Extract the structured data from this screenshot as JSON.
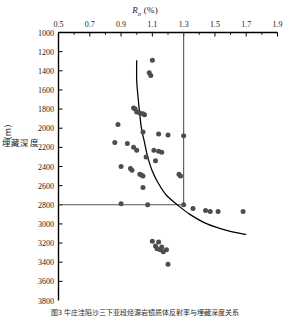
{
  "figure": {
    "caption": "图3  牛庄洼陷沙三下亚段烃源岩镜质体反射率与埋藏深度关系"
  },
  "chart_data": {
    "type": "scatter",
    "title": "",
    "xlabel": "Ro (%)",
    "xlabel_symbol": "R",
    "xlabel_subscript": "o",
    "xlabel_unit": "(%)",
    "ylabel": "埋藏深度 (m)",
    "ylabel_unit": "m",
    "ylabel_text": "埋藏深度",
    "xlim": [
      0.5,
      1.9
    ],
    "ylim": [
      1000,
      3800
    ],
    "y_inverted": true,
    "grid": false,
    "legend": null,
    "xticks": [
      0.5,
      0.7,
      0.9,
      1.1,
      1.3,
      1.5,
      1.7,
      1.9
    ],
    "xtick_labels": [
      "0.5",
      "0.7",
      "0.9",
      "1.1",
      "1.3",
      "1.5",
      "1.7",
      "1.9"
    ],
    "x_minor_ticks": [
      0.6,
      0.8,
      1.0,
      1.2,
      1.4,
      1.6,
      1.8
    ],
    "yticks": [
      1000,
      1200,
      1400,
      1600,
      1800,
      2000,
      2200,
      2400,
      2600,
      2800,
      3000,
      3200,
      3400,
      3600,
      3800
    ],
    "ytick_labels": [
      "1000",
      "1200",
      "1400",
      "1600",
      "1800",
      "2000",
      "2200",
      "2400",
      "2600",
      "2800",
      "3000",
      "3200",
      "3400",
      "3600",
      "3800"
    ],
    "point_color": "#4d4d4d",
    "line_color": "#000000",
    "reference_lines": [
      {
        "name": "ro-threshold",
        "orientation": "vertical",
        "value": 1.3,
        "label": "1.3",
        "from": 1000,
        "to": 2800,
        "color": "#555555"
      },
      {
        "name": "depth-threshold",
        "orientation": "horizontal",
        "value": 2800,
        "label": "2800",
        "from": 0.5,
        "to": 1.3,
        "color": "#555555"
      }
    ],
    "trend_curve": {
      "name": "maturity-trend",
      "points": [
        [
          1.0,
          1290
        ],
        [
          1.0,
          1500
        ],
        [
          1.01,
          1700
        ],
        [
          1.02,
          1860
        ],
        [
          1.03,
          2000
        ],
        [
          1.05,
          2150
        ],
        [
          1.07,
          2300
        ],
        [
          1.1,
          2450
        ],
        [
          1.14,
          2580
        ],
        [
          1.19,
          2700
        ],
        [
          1.26,
          2800
        ],
        [
          1.34,
          2900
        ],
        [
          1.45,
          3000
        ],
        [
          1.58,
          3070
        ],
        [
          1.7,
          3110
        ]
      ]
    },
    "series": [
      {
        "name": "source-rock-samples",
        "marker": "circle",
        "x": [
          1.1,
          1.08,
          1.09,
          0.98,
          0.99,
          1.0,
          1.02,
          1.04,
          1.05,
          0.88,
          1.04,
          1.14,
          1.2,
          1.3,
          0.86,
          0.94,
          0.98,
          1.0,
          1.11,
          1.14,
          1.16,
          1.06,
          1.12,
          0.9,
          0.96,
          0.97,
          1.02,
          1.03,
          1.04,
          1.27,
          1.28,
          1.04,
          0.9,
          1.07,
          1.3,
          1.36,
          1.44,
          1.47,
          1.52,
          1.68,
          1.1,
          1.14,
          1.12,
          1.16,
          1.13,
          1.15,
          1.19,
          1.17,
          1.2
        ],
        "y": [
          1290,
          1420,
          1450,
          1790,
          1800,
          1830,
          1840,
          1850,
          1860,
          1960,
          2040,
          2060,
          2070,
          2080,
          2150,
          2160,
          2200,
          2230,
          2230,
          2240,
          2250,
          2300,
          2340,
          2400,
          2420,
          2440,
          2480,
          2490,
          2500,
          2480,
          2500,
          2620,
          2790,
          2800,
          2800,
          2840,
          2860,
          2870,
          2870,
          2870,
          3180,
          3190,
          3230,
          3240,
          3260,
          3270,
          3270,
          3290,
          3420
        ]
      }
    ]
  }
}
